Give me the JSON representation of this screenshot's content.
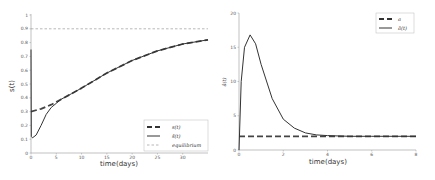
{
  "chart_data": [
    {
      "type": "line",
      "title": "",
      "xlabel": "time(days)",
      "ylabel": "s(t)",
      "xlim": [
        0,
        35
      ],
      "ylim": [
        0,
        1
      ],
      "xticks": [
        "0",
        "5",
        "10",
        "15",
        "20",
        "25",
        "30"
      ],
      "yticks": [
        "0",
        "0.1",
        "0.2",
        "0.3",
        "0.4",
        "0.5",
        "0.6",
        "0.7",
        "0.8",
        "0.9",
        "1"
      ],
      "grid": false,
      "legend_position": "lower right",
      "legend": [
        "s(t)",
        "ŝ(t)",
        "equilibrium"
      ],
      "series": [
        {
          "name": "s(t)",
          "style": "dashed-thick",
          "x": [
            0,
            2,
            4,
            6,
            8,
            10,
            15,
            20,
            25,
            30,
            35
          ],
          "y": [
            0.3,
            0.32,
            0.35,
            0.39,
            0.43,
            0.47,
            0.58,
            0.67,
            0.74,
            0.79,
            0.82
          ]
        },
        {
          "name": "ŝ(t)",
          "style": "solid",
          "x": [
            0,
            0.05,
            0.3,
            1,
            2,
            3,
            4,
            5,
            6,
            8,
            10,
            15,
            20,
            25,
            30,
            35
          ],
          "y": [
            0.75,
            0.12,
            0.11,
            0.13,
            0.2,
            0.28,
            0.33,
            0.36,
            0.39,
            0.43,
            0.47,
            0.58,
            0.67,
            0.74,
            0.79,
            0.82
          ]
        },
        {
          "name": "equilibrium",
          "style": "dashed-thin",
          "x": [
            0,
            35
          ],
          "y": [
            0.9,
            0.9
          ]
        }
      ]
    },
    {
      "type": "line",
      "title": "",
      "xlabel": "time(days)",
      "ylabel": "â(t)",
      "xlim": [
        0,
        8
      ],
      "ylim": [
        0,
        20
      ],
      "xticks": [
        "0",
        "2",
        "4",
        "6",
        "8"
      ],
      "yticks": [
        "0",
        "5",
        "10",
        "15",
        "20"
      ],
      "grid": false,
      "legend_position": "upper right",
      "legend": [
        "a",
        "â(t)"
      ],
      "series": [
        {
          "name": "a",
          "style": "dashed-thick",
          "x": [
            0,
            8
          ],
          "y": [
            2,
            2
          ]
        },
        {
          "name": "â(t)",
          "style": "solid",
          "x": [
            0,
            0.1,
            0.25,
            0.5,
            0.75,
            1,
            1.5,
            2,
            2.5,
            3,
            3.5,
            4,
            5,
            6,
            8
          ],
          "y": [
            0,
            10,
            15,
            16.8,
            15.5,
            12.5,
            7.5,
            4.5,
            3.2,
            2.5,
            2.2,
            2.1,
            2.0,
            2.0,
            2.0
          ]
        }
      ]
    }
  ],
  "left": {
    "ylabel": "s(t)",
    "xlabel": "time(days)",
    "xticks": [
      "0",
      "5",
      "10",
      "15",
      "20",
      "25",
      "30"
    ],
    "yticks": [
      "0",
      "0.1",
      "0.2",
      "0.3",
      "0.4",
      "0.5",
      "0.6",
      "0.7",
      "0.8",
      "0.9",
      "1"
    ],
    "legend": [
      "s(t)",
      "ŝ(t)",
      "equilibrium"
    ]
  },
  "right": {
    "ylabel": "â(t)",
    "xlabel": "time(days)",
    "xticks": [
      "0",
      "2",
      "4",
      "6",
      "8"
    ],
    "yticks": [
      "0",
      "5",
      "10",
      "15",
      "20"
    ],
    "legend": [
      "a",
      "â(t)"
    ]
  },
  "colors": {
    "line": "#333333",
    "equilibrium": "#999999",
    "axis": "#888888"
  }
}
